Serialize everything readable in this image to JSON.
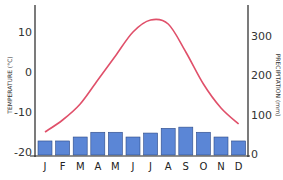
{
  "chart_data": {
    "type": "bar+line",
    "title": "",
    "categories": [
      "J",
      "F",
      "M",
      "A",
      "M",
      "J",
      "J",
      "A",
      "S",
      "O",
      "N",
      "D"
    ],
    "series": [
      {
        "name": "Precipitation (mm)",
        "type": "bar",
        "axis": "right",
        "color": "#5b86d6",
        "values": [
          33,
          33,
          43,
          55,
          55,
          43,
          53,
          65,
          68,
          55,
          43,
          33
        ]
      },
      {
        "name": "Temperature (°C)",
        "type": "line",
        "axis": "left",
        "color": "#e0506a",
        "values": [
          -15,
          -12,
          -8,
          -2,
          4,
          10,
          13,
          12,
          5,
          -3,
          -9,
          -13
        ]
      }
    ],
    "ylabel_left": "TEMPERATURE (°C)",
    "ylabel_right": "PRECIPITATION (mm)",
    "yticks_left": [
      "10",
      "0",
      "-10",
      "-20"
    ],
    "yticks_right": [
      "300",
      "200",
      "100",
      "0"
    ],
    "ylim_left": [
      -20,
      15
    ],
    "ylim_right": [
      0,
      350
    ],
    "grid": false,
    "legend": "none"
  }
}
